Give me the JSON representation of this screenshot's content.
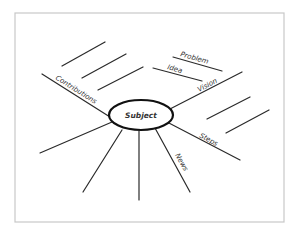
{
  "diagram": {
    "type": "mind-map-spider",
    "frame": {
      "x": 15,
      "y": 13,
      "width": 269,
      "height": 209,
      "stroke": "#c8c8c8"
    },
    "colors": {
      "line": "#2a2a2a",
      "text": "#333333",
      "background": "#ffffff"
    },
    "center": {
      "label": "Subject",
      "cx": 141,
      "cy": 115,
      "rx": 32,
      "ry": 15
    },
    "branches": [
      {
        "id": "contributions",
        "label": "Contributions",
        "line": {
          "x1": 42,
          "y1": 74,
          "x2": 110,
          "y2": 117
        },
        "label_pos": {
          "x": 55,
          "y": 79,
          "angle": 32
        },
        "sub_lines": [
          {
            "x1": 62,
            "y1": 66,
            "x2": 105,
            "y2": 42
          },
          {
            "x1": 82,
            "y1": 78,
            "x2": 126,
            "y2": 54
          },
          {
            "x1": 98,
            "y1": 90,
            "x2": 143,
            "y2": 67
          }
        ]
      },
      {
        "id": "vision",
        "label": "Vision",
        "line": {
          "x1": 168,
          "y1": 110,
          "x2": 242,
          "y2": 72
        },
        "label_pos": {
          "x": 199,
          "y": 92,
          "angle": -28
        },
        "sub_lines": [
          {
            "x1": 173,
            "y1": 57,
            "x2": 222,
            "y2": 71,
            "label": "Problem",
            "label_pos": {
              "x": 180,
              "y": 56,
              "angle": 16
            }
          },
          {
            "x1": 153,
            "y1": 68,
            "x2": 202,
            "y2": 81,
            "label": "Idea",
            "label_pos": {
              "x": 167,
              "y": 69,
              "angle": 16
            }
          }
        ]
      },
      {
        "id": "steps",
        "label": "Steps",
        "line": {
          "x1": 167,
          "y1": 122,
          "x2": 240,
          "y2": 160
        },
        "label_pos": {
          "x": 199,
          "y": 137,
          "angle": 28
        },
        "sub_lines": [
          {
            "x1": 207,
            "y1": 119,
            "x2": 250,
            "y2": 97
          },
          {
            "x1": 226,
            "y1": 133,
            "x2": 269,
            "y2": 110
          }
        ]
      },
      {
        "id": "news",
        "label": "News",
        "line": {
          "x1": 155,
          "y1": 128,
          "x2": 190,
          "y2": 192
        },
        "label_pos": {
          "x": 175,
          "y": 155,
          "angle": 61
        },
        "sub_lines": []
      },
      {
        "id": "unlabeled-bottom",
        "label": "",
        "line": {
          "x1": 139,
          "y1": 131,
          "x2": 139,
          "y2": 200
        },
        "sub_lines": []
      },
      {
        "id": "unlabeled-lower-left",
        "label": "",
        "line": {
          "x1": 122,
          "y1": 130,
          "x2": 83,
          "y2": 192
        },
        "sub_lines": []
      },
      {
        "id": "unlabeled-left",
        "label": "",
        "line": {
          "x1": 112,
          "y1": 122,
          "x2": 40,
          "y2": 153
        },
        "sub_lines": []
      }
    ]
  }
}
